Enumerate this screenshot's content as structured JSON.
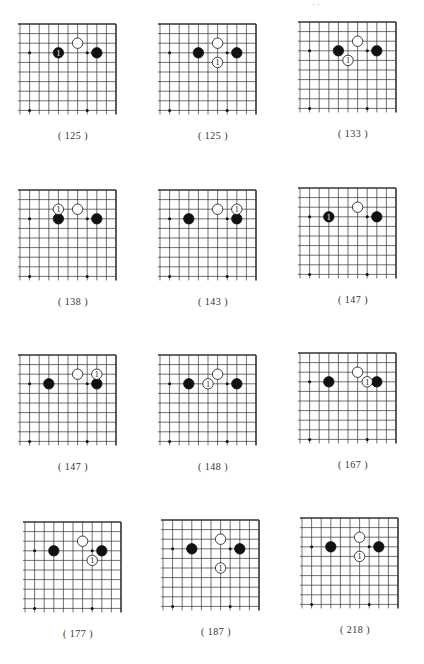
{
  "page": {
    "header_fragment": "· ·",
    "grid": {
      "cols": 11,
      "rows": 10,
      "spacing": 9.6,
      "star_points": [
        [
          3,
          3
        ],
        [
          9,
          3
        ],
        [
          3,
          9
        ],
        [
          9,
          9
        ]
      ],
      "corner": "top-right"
    },
    "base_note": "Coordinates are [column-from-right-edge, row-from-top-edge], 0-based"
  },
  "diagrams": [
    {
      "caption": "( 125 )",
      "x": 20,
      "y": 24,
      "stones": [
        {
          "c": "w",
          "pos": [
            4,
            2
          ]
        },
        {
          "c": "b",
          "pos": [
            2,
            3
          ]
        },
        {
          "c": "b",
          "pos": [
            6,
            3
          ],
          "label": "1"
        }
      ]
    },
    {
      "caption": "( 125 )",
      "x": 160,
      "y": 24,
      "stones": [
        {
          "c": "w",
          "pos": [
            4,
            2
          ]
        },
        {
          "c": "b",
          "pos": [
            2,
            3
          ]
        },
        {
          "c": "b",
          "pos": [
            6,
            3
          ]
        },
        {
          "c": "w",
          "pos": [
            4,
            4
          ],
          "label": "1"
        }
      ]
    },
    {
      "caption": "( 133 )",
      "x": 300,
      "y": 22,
      "stones": [
        {
          "c": "w",
          "pos": [
            4,
            2
          ]
        },
        {
          "c": "b",
          "pos": [
            2,
            3
          ]
        },
        {
          "c": "b",
          "pos": [
            6,
            3
          ]
        },
        {
          "c": "w",
          "pos": [
            5,
            4
          ],
          "label": "1"
        }
      ]
    },
    {
      "caption": "( 138 )",
      "x": 20,
      "y": 190,
      "stones": [
        {
          "c": "w",
          "pos": [
            4,
            2
          ]
        },
        {
          "c": "b",
          "pos": [
            2,
            3
          ]
        },
        {
          "c": "b",
          "pos": [
            6,
            3
          ]
        },
        {
          "c": "w",
          "pos": [
            6,
            2
          ],
          "label": "1"
        }
      ]
    },
    {
      "caption": "( 143 )",
      "x": 160,
      "y": 190,
      "stones": [
        {
          "c": "w",
          "pos": [
            4,
            2
          ]
        },
        {
          "c": "b",
          "pos": [
            2,
            3
          ]
        },
        {
          "c": "b",
          "pos": [
            7,
            3
          ]
        },
        {
          "c": "w",
          "pos": [
            2,
            2
          ],
          "label": "1"
        }
      ]
    },
    {
      "caption": "( 147 )",
      "x": 300,
      "y": 188,
      "stones": [
        {
          "c": "w",
          "pos": [
            4,
            2
          ]
        },
        {
          "c": "b",
          "pos": [
            2,
            3
          ]
        },
        {
          "c": "b",
          "pos": [
            7,
            3
          ],
          "label": "1"
        }
      ]
    },
    {
      "caption": "( 147 )",
      "x": 20,
      "y": 355,
      "stones": [
        {
          "c": "w",
          "pos": [
            4,
            2
          ]
        },
        {
          "c": "b",
          "pos": [
            2,
            3
          ]
        },
        {
          "c": "b",
          "pos": [
            7,
            3
          ]
        },
        {
          "c": "w",
          "pos": [
            2,
            2
          ],
          "label": "1"
        }
      ]
    },
    {
      "caption": "( 148 )",
      "x": 160,
      "y": 355,
      "stones": [
        {
          "c": "w",
          "pos": [
            4,
            2
          ]
        },
        {
          "c": "b",
          "pos": [
            2,
            3
          ]
        },
        {
          "c": "b",
          "pos": [
            7,
            3
          ]
        },
        {
          "c": "w",
          "pos": [
            5,
            3
          ],
          "label": "1"
        }
      ]
    },
    {
      "caption": "( 167 )",
      "x": 300,
      "y": 353,
      "stones": [
        {
          "c": "w",
          "pos": [
            4,
            2
          ]
        },
        {
          "c": "b",
          "pos": [
            2,
            3
          ]
        },
        {
          "c": "b",
          "pos": [
            7,
            3
          ]
        },
        {
          "c": "w",
          "pos": [
            3,
            3
          ],
          "label": "1"
        }
      ]
    },
    {
      "caption": "( 177 )",
      "x": 25,
      "y": 522,
      "stones": [
        {
          "c": "w",
          "pos": [
            4,
            2
          ]
        },
        {
          "c": "b",
          "pos": [
            2,
            3
          ]
        },
        {
          "c": "b",
          "pos": [
            7,
            3
          ]
        },
        {
          "c": "w",
          "pos": [
            3,
            4
          ],
          "label": "1"
        }
      ]
    },
    {
      "caption": "( 187 )",
      "x": 163,
      "y": 520,
      "stones": [
        {
          "c": "w",
          "pos": [
            4,
            2
          ]
        },
        {
          "c": "b",
          "pos": [
            2,
            3
          ]
        },
        {
          "c": "b",
          "pos": [
            7,
            3
          ]
        },
        {
          "c": "w",
          "pos": [
            4,
            5
          ],
          "label": "1"
        }
      ]
    },
    {
      "caption": "( 218 )",
      "x": 302,
      "y": 518,
      "stones": [
        {
          "c": "w",
          "pos": [
            4,
            2
          ]
        },
        {
          "c": "b",
          "pos": [
            2,
            3
          ]
        },
        {
          "c": "b",
          "pos": [
            7,
            3
          ]
        },
        {
          "c": "w",
          "pos": [
            4,
            4
          ],
          "label": "1"
        }
      ]
    }
  ]
}
